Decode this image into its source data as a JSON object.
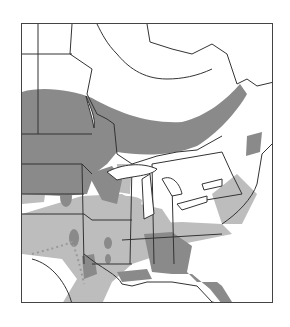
{
  "map": {
    "type": "species range map",
    "region": "Eastern North America",
    "legend": [
      {
        "label": "dense range",
        "color": "#8a8a8a"
      },
      {
        "label": "sparse range",
        "color": "#bdbdbd"
      }
    ],
    "colors": {
      "land": "#ffffff",
      "water": "#ffffff",
      "border": "#333333",
      "frame": "#444444",
      "dark_range": "#8a8a8a",
      "light_range": "#bdbdbd",
      "dotted_boundary": "#9a9a9a"
    }
  }
}
